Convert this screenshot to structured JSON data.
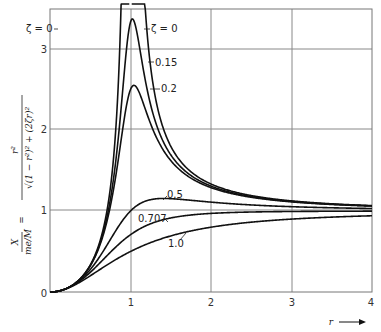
{
  "chart_data": {
    "type": "line",
    "title": "",
    "xlabel": "r",
    "ylabel": "X / (me/M) = r^2 / sqrt((1 - r^2)^2 + (2ζr)^2)",
    "xlim": [
      0,
      4
    ],
    "ylim": [
      0,
      3.5
    ],
    "grid": true,
    "x_ticks": [
      "0",
      "1",
      "2",
      "3",
      "4"
    ],
    "y_ticks": [
      "0",
      "1",
      "2",
      "3"
    ],
    "formula": "r^2/sqrt((1-r^2)^2+(2*zeta*r)^2)",
    "series": [
      {
        "name": "ζ = 0",
        "zeta": 0,
        "label": "ζ = 0",
        "peak": "∞ at r = 1"
      },
      {
        "name": "0.15",
        "zeta": 0.15,
        "label": "0.15",
        "peak": 3.33
      },
      {
        "name": "0.2",
        "zeta": 0.2,
        "label": "0.2",
        "peak": 2.55
      },
      {
        "name": "0.5",
        "zeta": 0.5,
        "label": "0.5",
        "peak": 1.15
      },
      {
        "name": "0.707",
        "zeta": 0.707,
        "label": "0.707",
        "peak": 1.0
      },
      {
        "name": "1.0",
        "zeta": 1.0,
        "label": "1.0",
        "peak": 1.0
      }
    ],
    "sample_values": {
      "r": [
        0,
        0.5,
        1,
        1.5,
        2,
        3,
        4
      ],
      "zeta_0.15": [
        0,
        0.33,
        3.33,
        1.72,
        1.31,
        1.12,
        1.07
      ],
      "zeta_0.2": [
        0,
        0.32,
        2.5,
        1.65,
        1.29,
        1.12,
        1.06
      ],
      "zeta_0.5": [
        0,
        0.28,
        1.0,
        1.12,
        1.11,
        1.07,
        1.04
      ],
      "zeta_0.707": [
        0,
        0.24,
        0.71,
        0.91,
        0.97,
        0.99,
        1.0
      ],
      "zeta_1.0": [
        0,
        0.2,
        0.5,
        0.69,
        0.8,
        0.9,
        0.94
      ]
    }
  },
  "labels": {
    "zeta0_left": "ζ = 0",
    "zeta0_right": "ζ = 0",
    "z015": "0.15",
    "z02": "0.2",
    "z05": "0.5",
    "z0707": "0.707",
    "z10": "1.0",
    "x_axis": "r",
    "y_numer": "X",
    "y_denom": "me/M",
    "y_eq": "=",
    "y_formula_num": "r²",
    "y_formula_den": "√(1 − r²)² + (2ζr)²"
  }
}
